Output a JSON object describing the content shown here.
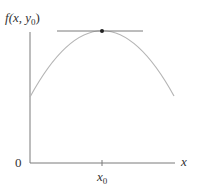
{
  "diagram": {
    "y_label": {
      "func": "f",
      "args_open": "(x, y",
      "sub": "0",
      "args_close": ")"
    },
    "x_label": "x",
    "origin_label": "0",
    "tick_label": {
      "base": "x",
      "sub": "0"
    },
    "elements": [
      "y-axis",
      "x-axis",
      "concave-down curve",
      "horizontal tangent line at maximum",
      "maximum point"
    ],
    "colors": {
      "axis": "#7a7a7a",
      "curve": "#b5b5b5",
      "tangent": "#7a7a7a",
      "point": "#222222",
      "text": "#333333"
    }
  }
}
